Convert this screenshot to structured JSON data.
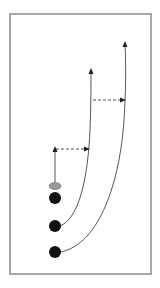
{
  "diagram": {
    "title": "",
    "type": "play-diagram",
    "colors": {
      "background": "#ffffff",
      "frame": "#8a8a8a",
      "line": "#555555",
      "player": "#111111",
      "cone": "#9a9a9a"
    },
    "frame": {
      "x": 10,
      "y": 14,
      "width": 141,
      "height": 260
    },
    "cone": {
      "cx": 55,
      "cy": 186,
      "rx": 6,
      "ry": 3.5
    },
    "players": [
      {
        "id": "player-1",
        "cx": 55,
        "cy": 198,
        "r": 6
      },
      {
        "id": "player-2",
        "cx": 55,
        "cy": 226,
        "r": 6
      },
      {
        "id": "player-3",
        "cx": 55,
        "cy": 252,
        "r": 6
      }
    ],
    "paths": [
      {
        "id": "run-straight",
        "style": "solid",
        "d": "M55,182 L55,150"
      },
      {
        "id": "pass-1",
        "style": "dashed",
        "d": "M56,149 L88,149"
      },
      {
        "id": "run-curve-mid",
        "style": "solid",
        "d": "M60,226 C80,218 88,175 90,130 C91,105 91,85 91,72"
      },
      {
        "id": "pass-2",
        "style": "dashed",
        "d": "M93,100 L124,100"
      },
      {
        "id": "run-curve-outer",
        "style": "solid",
        "d": "M60,252 C100,245 120,180 124,120 C126,90 126,60 125,45"
      }
    ],
    "arrowheads": [
      {
        "id": "arrow-straight",
        "x": 55,
        "y": 146,
        "dir": "up"
      },
      {
        "id": "arrow-pass-1",
        "x": 90,
        "y": 149,
        "dir": "right"
      },
      {
        "id": "arrow-mid",
        "x": 91,
        "y": 68,
        "dir": "up"
      },
      {
        "id": "arrow-pass-2",
        "x": 126,
        "y": 100,
        "dir": "right"
      },
      {
        "id": "arrow-outer",
        "x": 125,
        "y": 41,
        "dir": "up"
      }
    ]
  }
}
